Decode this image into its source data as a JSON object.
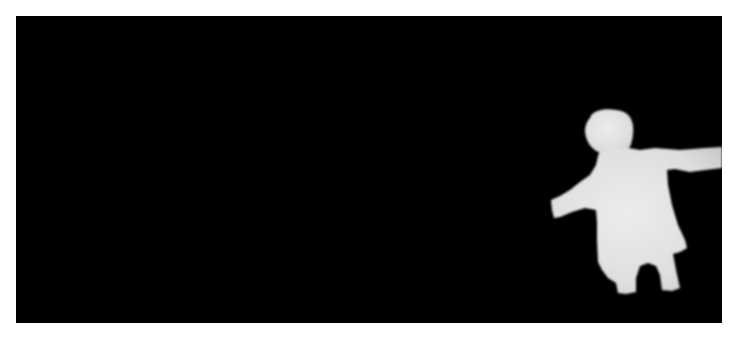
{
  "image": {
    "kind": "depth-map silhouette",
    "subject": "child with outstretched arms",
    "background_color": "#000000",
    "foreground_color": "#e6e6e6",
    "page_background": "#ffffff"
  }
}
